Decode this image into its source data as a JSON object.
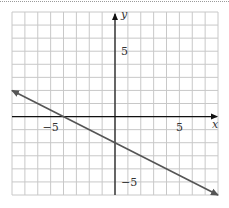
{
  "chart_data": {
    "type": "line",
    "title": "",
    "xlabel": "x",
    "ylabel": "y",
    "xlim": [
      -8,
      8
    ],
    "ylim": [
      -6,
      8
    ],
    "grid": true,
    "grid_step": 1,
    "x_ticks_labeled": [
      {
        "value": -5,
        "label": "−5"
      },
      {
        "value": 5,
        "label": "5"
      }
    ],
    "y_ticks_labeled": [
      {
        "value": 5,
        "label": "5"
      },
      {
        "value": -5,
        "label": "−5"
      }
    ],
    "series": [
      {
        "name": "line",
        "equation": "y = -0.5x - 2",
        "x": [
          -8,
          -4,
          0,
          8
        ],
        "y": [
          2,
          0,
          -2,
          -6
        ],
        "arrows_both_ends": true,
        "color": "#555555"
      }
    ],
    "intercepts": {
      "x_intercept": -4,
      "y_intercept": -2
    }
  },
  "colors": {
    "grid": "#c8c8c8",
    "axis": "#111111",
    "line": "#555555",
    "frame_border": "#9a9a9a"
  }
}
